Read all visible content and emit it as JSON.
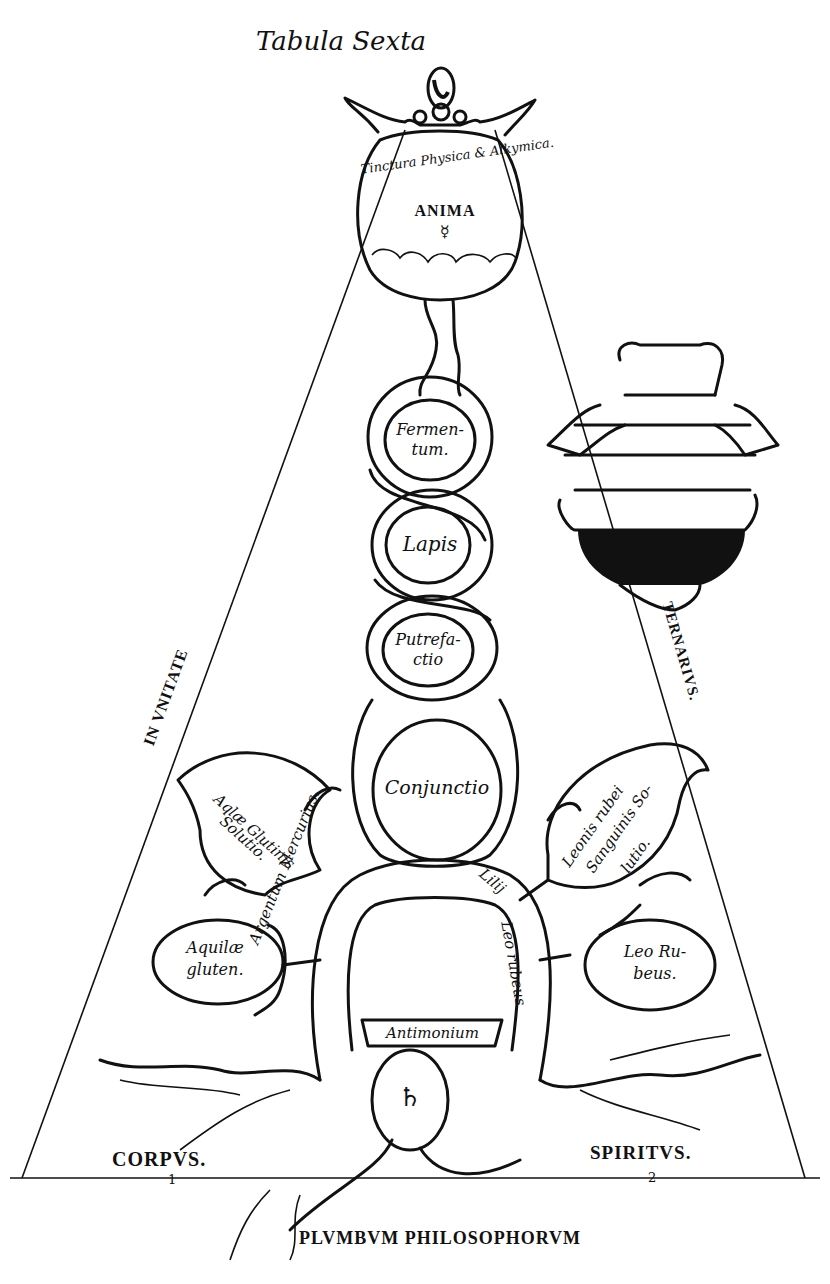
{
  "title": "Tabula Sexta",
  "flasks": {
    "anima": {
      "label": "ANIMA",
      "symbol": "☿",
      "ring_text": "Tinctura Physica & Alkymica."
    },
    "fermentum": {
      "line1": "Fermen-",
      "line2": "tum."
    },
    "lapis": {
      "label": "Lapis"
    },
    "putrefactio": {
      "line1": "Putrefa-",
      "line2": "ctio"
    },
    "conjunctio": {
      "label": "Conjunctio"
    },
    "antimonium": {
      "label": "Antimonium"
    },
    "base_symbol": "♄"
  },
  "leaves": {
    "aquila_gluten_solutio": {
      "line1": "Aqlæ Glutinis",
      "line2": "Solutio."
    },
    "leonis_rubei": {
      "line1": "Leonis rubei",
      "line2": "Sanguinis So-",
      "line3": "lutio."
    },
    "aquila_gluten": {
      "line1": "Aquilæ",
      "line2": "gluten."
    },
    "leo_rubeus": {
      "line1": "Leo Ru-",
      "line2": "beus."
    }
  },
  "arch": {
    "left": "Argentum Mercurius.",
    "right_top": "Lilij",
    "right": "Leo rubeus"
  },
  "side_labels": {
    "left": "IN VNITATE",
    "right": "TERNARIVS."
  },
  "base": {
    "corpus": "CORPVS.",
    "corpus_num": "1",
    "spiritus": "SPIRITVS.",
    "spiritus_num": "2",
    "caption": "PLVMBVM PHILOSOPHORVM"
  }
}
